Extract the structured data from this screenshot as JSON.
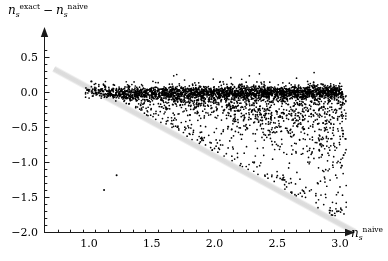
{
  "chart_data": {
    "type": "scatter",
    "title": "",
    "ylabel_parts": {
      "var1": "n",
      "var1_sub": "s",
      "var1_sup": "exact",
      "operator": "−",
      "var2": "n",
      "var2_sub": "s",
      "var2_sup": "naive"
    },
    "xlabel_parts": {
      "var": "n",
      "var_sub": "s",
      "var_sup": "naive"
    },
    "ylabel": "n_s^exact − n_s^naive",
    "xlabel": "n_s^naive",
    "xlim": [
      0.68,
      3.25
    ],
    "ylim": [
      -2.0,
      0.72
    ],
    "xticks": [
      1.0,
      1.5,
      2.0,
      2.5,
      3.0
    ],
    "xtick_labels": [
      "1.0",
      "1.5",
      "2.0",
      "2.5",
      "3.0"
    ],
    "yticks": [
      0.5,
      0.0,
      -0.5,
      -1.0,
      -1.5,
      -2.0
    ],
    "ytick_labels": [
      "0.5",
      "0.0",
      "−0.5",
      "−1.0",
      "−1.5",
      "−2.0"
    ],
    "xminor_per_major": 5,
    "yminor_per_major": 5,
    "grid": false,
    "legend": null,
    "axis_style": "arrow-axes-origin-at-left",
    "point_color": "#000000",
    "point_size_px": 1.7,
    "band": {
      "name": "exclusion-band",
      "color": "#e2e2e2",
      "x_start": 0.72,
      "y_start": 0.33,
      "x_end": 3.12,
      "y_end": -2.0,
      "thickness_units": 0.11
    },
    "n_points": 3300,
    "cloud_description": "dense horizontal locus at y=0 from x=0.95 to x=3.0, fanning downward to the right with tail reaching y=-1.6",
    "series": [
      {
        "name": "main-locus",
        "n": 1900,
        "x_range": [
          0.95,
          3.02
        ],
        "y_center": 0.0,
        "y_sigma": 0.045
      },
      {
        "name": "downward-fan",
        "n": 1300,
        "x_range": [
          1.0,
          3.05
        ],
        "y_center": -0.12,
        "y_spread_model": "widening with x, bounded below by band"
      },
      {
        "name": "isolated-outliers",
        "n": 2,
        "points": [
          [
            1.22,
            -1.19
          ],
          [
            1.12,
            -1.4
          ]
        ]
      }
    ]
  },
  "figure": {
    "background_color": "#ffffff",
    "axis_color": "#1a1a1a",
    "tick_color": "#1a1a1a"
  }
}
